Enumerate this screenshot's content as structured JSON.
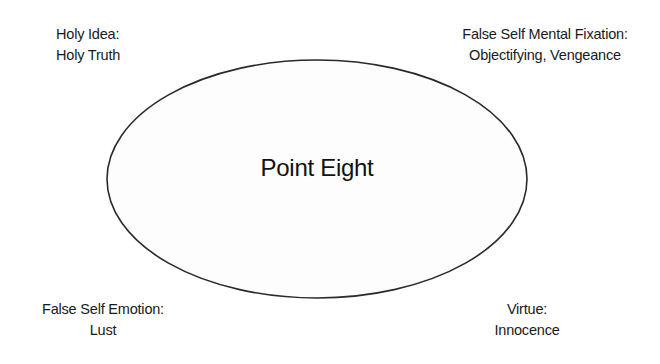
{
  "diagram": {
    "center": {
      "label": "Point Eight"
    },
    "ellipse": {
      "cx": 317,
      "cy": 179,
      "rx": 210,
      "ry": 119,
      "stroke": "#2a2a2a",
      "fill": "#fdfdfd"
    },
    "corners": {
      "top_left": {
        "title": "Holy Idea:",
        "value": "Holy Truth"
      },
      "top_right": {
        "title": "False Self Mental Fixation:",
        "value": "Objectifying, Vengeance"
      },
      "bottom_left": {
        "title": "False Self Emotion:",
        "value": "Lust"
      },
      "bottom_right": {
        "title": "Virtue:",
        "value": "Innocence"
      }
    }
  }
}
